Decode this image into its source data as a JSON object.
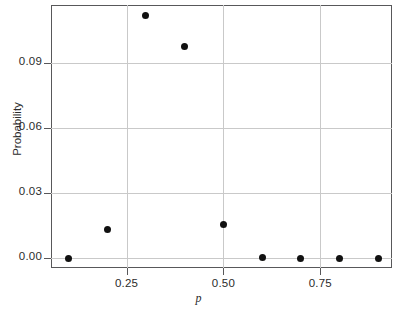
{
  "chart_data": {
    "type": "scatter",
    "title": "",
    "subtitle": "",
    "xlabel": "p",
    "ylabel": "Probability",
    "x": [
      0.1,
      0.2,
      0.3,
      0.4,
      0.5,
      0.6,
      0.7,
      0.8,
      0.9
    ],
    "values": [
      0.0,
      0.0134,
      0.1117,
      0.0974,
      0.0157,
      0.0003,
      0.0,
      0.0,
      0.0
    ],
    "xlim": [
      0.055,
      0.935
    ],
    "ylim": [
      -0.0045,
      0.1166
    ],
    "xticks": [
      0.25,
      0.5,
      0.75
    ],
    "xticklabels": [
      "0.25",
      "0.50",
      "0.75"
    ],
    "yticks": [
      0.0,
      0.03,
      0.06,
      0.09
    ],
    "yticklabels": [
      "0.00",
      "0.03",
      "0.06",
      "0.09"
    ],
    "grid": true,
    "grid_color": "#c9c9c9",
    "legend": null,
    "marker": "filled-circle",
    "marker_color": "#111111",
    "frame_color": "#58585a",
    "background": "#ffffff"
  }
}
